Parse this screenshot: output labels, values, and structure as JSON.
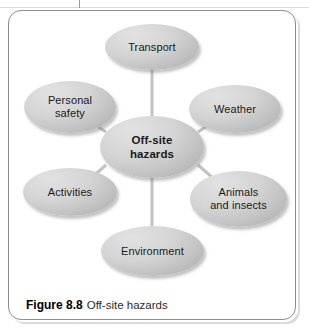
{
  "figure": {
    "caption_label": "Figure 8.8",
    "caption_text": "Off-site hazards",
    "center": {
      "id": "off-site-hazards",
      "line1": "Off-site",
      "line2": "hazards"
    },
    "nodes": [
      {
        "id": "transport",
        "line1": "Transport",
        "line2": ""
      },
      {
        "id": "weather",
        "line1": "Weather",
        "line2": ""
      },
      {
        "id": "animals-insects",
        "line1": "Animals",
        "line2": "and insects"
      },
      {
        "id": "environment",
        "line1": "Environment",
        "line2": ""
      },
      {
        "id": "activities",
        "line1": "Activities",
        "line2": ""
      },
      {
        "id": "personal-safety",
        "line1": "Personal",
        "line2": "safety"
      }
    ],
    "colors": {
      "node_fill_light": "#e2e2e2",
      "node_fill_dark": "#9c9c9c",
      "connector": "#c3c3c3",
      "frame_border": "#8d8d8d",
      "text": "#1a1a1a"
    }
  }
}
